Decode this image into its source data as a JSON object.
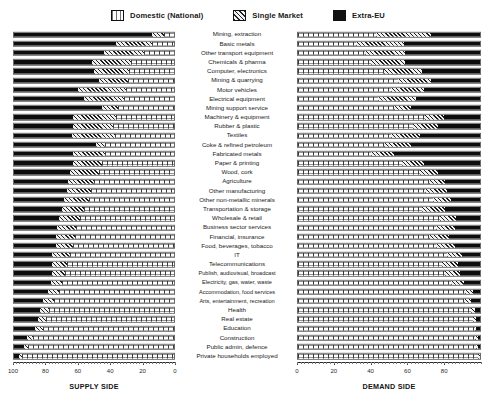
{
  "legend": {
    "items": [
      {
        "label": "Domestic (National)",
        "icon": "domestic-swatch",
        "color": "#ffffff"
      },
      {
        "label": "Single Market",
        "icon": "single-market-swatch",
        "color": "#cfcfcf"
      },
      {
        "label": "Extra-EU",
        "icon": "extra-eu-swatch",
        "color": "#111111"
      }
    ]
  },
  "axes": {
    "supply": {
      "title": "SUPPLY SIDE",
      "ticks": [
        100,
        80,
        60,
        40,
        20,
        0
      ],
      "min": 0,
      "max": 100,
      "reversed": true
    },
    "demand": {
      "title": "DEMAND SIDE",
      "ticks": [
        0,
        20,
        40,
        60,
        80
      ],
      "min": 0,
      "max": 100,
      "reversed": false
    }
  },
  "chart_data": {
    "type": "bar",
    "subtype": "stacked-horizontal-bidirectional",
    "title": "",
    "xlabel": "SUPPLY SIDE / DEMAND SIDE",
    "ylabel": "",
    "xlim": [
      0,
      100
    ],
    "grid": false,
    "legend_position": "top-center",
    "series_names": [
      "Domestic (National)",
      "Single Market",
      "Extra-EU"
    ],
    "panels": [
      {
        "name": "SUPPLY SIDE",
        "axis_reversed": true,
        "stack_order": [
          "Extra-EU",
          "Single Market",
          "Domestic (National)"
        ]
      },
      {
        "name": "DEMAND SIDE",
        "axis_reversed": false,
        "stack_order": [
          "Domestic (National)",
          "Single Market",
          "Extra-EU"
        ]
      }
    ],
    "categories": [
      "Mining, extraction",
      "Basic metals",
      "Other transport equipment",
      "Chemicals & pharma",
      "Computer, electronics",
      "Mining & quarrying",
      "Motor vehicles",
      "Electrical equipment",
      "Mining support service",
      "Machinery & equipment",
      "Rubber & plastic",
      "Textiles",
      "Coke & refined petroleum",
      "Fabricated metals",
      "Paper & printing",
      "Wood, cork",
      "Agriculture",
      "Other manufacturing",
      "Other non-metallic minerals",
      "Transportation & storage",
      "Wholesale & retail",
      "Business sector services",
      "Financial, insurance",
      "Food, beverages, tobacco",
      "IT",
      "Telecommunications",
      "Publish, audiovisual, broadcast",
      "Electricity, gas, water, waste",
      "Accommodation, food services",
      "Arts, entertainment, recreation",
      "Health",
      "Real estate",
      "Education",
      "Construction",
      "Public admin, defence",
      "Private households employed"
    ],
    "supply": {
      "domestic": [
        6,
        14,
        19,
        27,
        28,
        29,
        30,
        31,
        35,
        36,
        38,
        37,
        43,
        43,
        45,
        47,
        50,
        52,
        53,
        56,
        59,
        61,
        62,
        63,
        65,
        67,
        68,
        70,
        72,
        75,
        78,
        80,
        82,
        88,
        91,
        95,
        99
      ],
      "single_market": [
        8,
        22,
        25,
        24,
        22,
        18,
        30,
        25,
        10,
        27,
        25,
        27,
        6,
        20,
        18,
        18,
        16,
        15,
        16,
        14,
        13,
        12,
        12,
        11,
        11,
        9,
        8,
        7,
        7,
        7,
        6,
        5,
        5,
        4,
        3,
        2
      ],
      "extra_eu": [
        86,
        64,
        56,
        49,
        50,
        53,
        40,
        44,
        55,
        37,
        37,
        36,
        51,
        37,
        37,
        35,
        34,
        33,
        31,
        30,
        28,
        27,
        26,
        26,
        24,
        24,
        24,
        23,
        21,
        18,
        16,
        15,
        13,
        8,
        6,
        3
      ]
    },
    "demand": {
      "domestic": [
        43,
        32,
        37,
        40,
        47,
        55,
        51,
        44,
        53,
        70,
        63,
        51,
        47,
        40,
        57,
        67,
        72,
        78,
        83,
        86,
        90,
        93,
        94,
        95,
        96,
        97,
        98,
        98,
        99,
        99
      ],
      "single_market": [
        30,
        26,
        22,
        19,
        21,
        18,
        18,
        21,
        9,
        10,
        14,
        16,
        15,
        13,
        12,
        10,
        9,
        7,
        6,
        5,
        4,
        3,
        3,
        2,
        2,
        2,
        1,
        1,
        1,
        1
      ],
      "extra_eu": [
        27,
        42,
        41,
        41,
        32,
        27,
        31,
        35,
        38,
        20,
        23,
        33,
        38,
        47,
        31,
        23,
        19,
        15,
        11,
        9,
        6,
        4,
        3,
        3,
        2,
        1,
        1,
        1,
        0,
        0
      ]
    },
    "rows": [
      {
        "category": "Mining, extraction",
        "supply": {
          "extra_eu": 86,
          "single_market": 8,
          "domestic": 6
        },
        "demand": {
          "domestic": 43,
          "single_market": 30,
          "extra_eu": 27
        }
      },
      {
        "category": "Basic metals",
        "supply": {
          "extra_eu": 64,
          "single_market": 22,
          "domestic": 14
        },
        "demand": {
          "domestic": 32,
          "single_market": 26,
          "extra_eu": 42
        }
      },
      {
        "category": "Other transport equipment",
        "supply": {
          "extra_eu": 56,
          "single_market": 25,
          "domestic": 19
        },
        "demand": {
          "domestic": 37,
          "single_market": 22,
          "extra_eu": 41
        }
      },
      {
        "category": "Chemicals & pharma",
        "supply": {
          "extra_eu": 49,
          "single_market": 24,
          "domestic": 27
        },
        "demand": {
          "domestic": 40,
          "single_market": 19,
          "extra_eu": 41
        }
      },
      {
        "category": "Computer, electronics",
        "supply": {
          "extra_eu": 50,
          "single_market": 22,
          "domestic": 28
        },
        "demand": {
          "domestic": 47,
          "single_market": 21,
          "extra_eu": 32
        }
      },
      {
        "category": "Mining & quarrying",
        "supply": {
          "extra_eu": 53,
          "single_market": 18,
          "domestic": 29
        },
        "demand": {
          "domestic": 55,
          "single_market": 18,
          "extra_eu": 27
        }
      },
      {
        "category": "Motor vehicles",
        "supply": {
          "extra_eu": 40,
          "single_market": 30,
          "domestic": 30
        },
        "demand": {
          "domestic": 51,
          "single_market": 18,
          "extra_eu": 31
        }
      },
      {
        "category": "Electrical equipment",
        "supply": {
          "extra_eu": 44,
          "single_market": 25,
          "domestic": 31
        },
        "demand": {
          "domestic": 44,
          "single_market": 21,
          "extra_eu": 35
        }
      },
      {
        "category": "Mining support service",
        "supply": {
          "extra_eu": 55,
          "single_market": 10,
          "domestic": 35
        },
        "demand": {
          "domestic": 53,
          "single_market": 9,
          "extra_eu": 38
        }
      },
      {
        "category": "Machinery & equipment",
        "supply": {
          "extra_eu": 37,
          "single_market": 27,
          "domestic": 36
        },
        "demand": {
          "domestic": 70,
          "single_market": 10,
          "extra_eu": 20
        }
      },
      {
        "category": "Rubber & plastic",
        "supply": {
          "extra_eu": 37,
          "single_market": 25,
          "domestic": 38
        },
        "demand": {
          "domestic": 63,
          "single_market": 14,
          "extra_eu": 23
        }
      },
      {
        "category": "Textiles",
        "supply": {
          "extra_eu": 36,
          "single_market": 27,
          "domestic": 37
        },
        "demand": {
          "domestic": 51,
          "single_market": 16,
          "extra_eu": 33
        }
      },
      {
        "category": "Coke & refined petroleum",
        "supply": {
          "extra_eu": 51,
          "single_market": 6,
          "domestic": 43
        },
        "demand": {
          "domestic": 47,
          "single_market": 15,
          "extra_eu": 38
        }
      },
      {
        "category": "Fabricated metals",
        "supply": {
          "extra_eu": 37,
          "single_market": 20,
          "domestic": 43
        },
        "demand": {
          "domestic": 40,
          "single_market": 13,
          "extra_eu": 47
        }
      },
      {
        "category": "Paper & printing",
        "supply": {
          "extra_eu": 37,
          "single_market": 18,
          "domestic": 45
        },
        "demand": {
          "domestic": 57,
          "single_market": 12,
          "extra_eu": 31
        }
      },
      {
        "category": "Wood, cork",
        "supply": {
          "extra_eu": 35,
          "single_market": 18,
          "domestic": 47
        },
        "demand": {
          "domestic": 67,
          "single_market": 10,
          "extra_eu": 23
        }
      },
      {
        "category": "Agriculture",
        "supply": {
          "extra_eu": 34,
          "single_market": 16,
          "domestic": 50
        },
        "demand": {
          "domestic": 72,
          "single_market": 9,
          "extra_eu": 19
        }
      },
      {
        "category": "Other manufacturing",
        "supply": {
          "extra_eu": 33,
          "single_market": 15,
          "domestic": 52
        },
        "demand": {
          "domestic": 70,
          "single_market": 12,
          "extra_eu": 18
        }
      },
      {
        "category": "Other non-metallic minerals",
        "supply": {
          "extra_eu": 31,
          "single_market": 16,
          "domestic": 53
        },
        "demand": {
          "domestic": 74,
          "single_market": 10,
          "extra_eu": 16
        }
      },
      {
        "category": "Transportation & storage",
        "supply": {
          "extra_eu": 30,
          "single_market": 14,
          "domestic": 56
        },
        "demand": {
          "domestic": 68,
          "single_market": 13,
          "extra_eu": 19
        }
      },
      {
        "category": "Wholesale & retail",
        "supply": {
          "extra_eu": 28,
          "single_market": 13,
          "domestic": 59
        },
        "demand": {
          "domestic": 78,
          "single_market": 9,
          "extra_eu": 13
        }
      },
      {
        "category": "Business sector services",
        "supply": {
          "extra_eu": 27,
          "single_market": 12,
          "domestic": 61
        },
        "demand": {
          "domestic": 76,
          "single_market": 10,
          "extra_eu": 14
        }
      },
      {
        "category": "Financial, insurance",
        "supply": {
          "extra_eu": 26,
          "single_market": 12,
          "domestic": 62
        },
        "demand": {
          "domestic": 72,
          "single_market": 11,
          "extra_eu": 17
        }
      },
      {
        "category": "Food, beverages, tobacco",
        "supply": {
          "extra_eu": 26,
          "single_market": 11,
          "domestic": 63
        },
        "demand": {
          "domestic": 76,
          "single_market": 10,
          "extra_eu": 14
        }
      },
      {
        "category": "IT",
        "supply": {
          "extra_eu": 24,
          "single_market": 11,
          "domestic": 65
        },
        "demand": {
          "domestic": 82,
          "single_market": 8,
          "extra_eu": 10
        }
      },
      {
        "category": "Telecommunications",
        "supply": {
          "extra_eu": 24,
          "single_market": 9,
          "domestic": 67
        },
        "demand": {
          "domestic": 79,
          "single_market": 9,
          "extra_eu": 12
        }
      },
      {
        "category": "Publish, audiovisual, broadcast",
        "supply": {
          "extra_eu": 24,
          "single_market": 8,
          "domestic": 68
        },
        "demand": {
          "domestic": 81,
          "single_market": 8,
          "extra_eu": 11
        }
      },
      {
        "category": "Electricity, gas, water, waste",
        "supply": {
          "extra_eu": 23,
          "single_market": 7,
          "domestic": 70
        },
        "demand": {
          "domestic": 84,
          "single_market": 7,
          "extra_eu": 9
        }
      },
      {
        "category": "Accommodation, food services",
        "supply": {
          "extra_eu": 21,
          "single_market": 7,
          "domestic": 72
        },
        "demand": {
          "domestic": 92,
          "single_market": 4,
          "extra_eu": 4
        }
      },
      {
        "category": "Arts, entertainment, recreation",
        "supply": {
          "extra_eu": 18,
          "single_market": 7,
          "domestic": 75
        },
        "demand": {
          "domestic": 91,
          "single_market": 4,
          "extra_eu": 5
        }
      },
      {
        "category": "Health",
        "supply": {
          "extra_eu": 16,
          "single_market": 6,
          "domestic": 78
        },
        "demand": {
          "domestic": 95,
          "single_market": 2,
          "extra_eu": 3
        }
      },
      {
        "category": "Real estate",
        "supply": {
          "extra_eu": 15,
          "single_market": 5,
          "domestic": 80
        },
        "demand": {
          "domestic": 96,
          "single_market": 2,
          "extra_eu": 2
        }
      },
      {
        "category": "Education",
        "supply": {
          "extra_eu": 13,
          "single_market": 5,
          "domestic": 82
        },
        "demand": {
          "domestic": 97,
          "single_market": 1,
          "extra_eu": 2
        }
      },
      {
        "category": "Construction",
        "supply": {
          "extra_eu": 8,
          "single_market": 4,
          "domestic": 88
        },
        "demand": {
          "domestic": 97,
          "single_market": 2,
          "extra_eu": 1
        }
      },
      {
        "category": "Public admin, defence",
        "supply": {
          "extra_eu": 6,
          "single_market": 3,
          "domestic": 91
        },
        "demand": {
          "domestic": 98,
          "single_market": 1,
          "extra_eu": 1
        }
      },
      {
        "category": "Private households employed",
        "supply": {
          "extra_eu": 3,
          "single_market": 2,
          "domestic": 95
        },
        "demand": {
          "domestic": 99,
          "single_market": 1,
          "extra_eu": 0
        }
      }
    ]
  }
}
